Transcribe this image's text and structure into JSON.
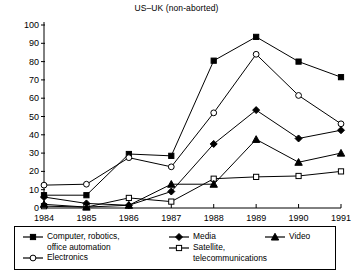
{
  "chart_data": {
    "type": "line",
    "title": "US–UK (non-aborted)",
    "xlabel": "",
    "ylabel": "",
    "categories": [
      "1984",
      "1985",
      "1986",
      "1987",
      "1988",
      "1989",
      "1990",
      "1991"
    ],
    "x": [
      1984,
      1985,
      1986,
      1987,
      1988,
      1989,
      1990,
      1991
    ],
    "xlim": [
      1984,
      1991
    ],
    "ylim": [
      0,
      100
    ],
    "yticks": [
      0,
      10,
      20,
      30,
      40,
      50,
      60,
      70,
      80,
      90,
      100
    ],
    "grid": false,
    "legend_position": "bottom",
    "series": [
      {
        "name": "Computer, robotics,\noffice automation",
        "marker": "filled-square",
        "values": [
          7,
          7,
          29.5,
          28.5,
          80.5,
          93.5,
          80,
          71.5
        ]
      },
      {
        "name": "Electronics",
        "marker": "open-circle",
        "values": [
          12.5,
          13,
          27.5,
          22.5,
          52,
          84,
          61.5,
          46
        ]
      },
      {
        "name": "Media",
        "marker": "filled-diamond",
        "values": [
          6,
          2.5,
          1.5,
          9,
          35,
          53.5,
          38,
          42.5
        ]
      },
      {
        "name": "Satellite,\ntelecommunications",
        "marker": "open-square",
        "values": [
          1,
          0.5,
          5.5,
          3.5,
          16,
          17,
          17.5,
          20
        ]
      },
      {
        "name": "Video",
        "marker": "filled-triangle",
        "values": [
          2,
          0.5,
          1.5,
          13,
          13,
          37.5,
          25,
          30
        ]
      }
    ]
  },
  "legend": {
    "entries": [
      {
        "label": "Computer, robotics,\noffice automation",
        "marker": "filled-square"
      },
      {
        "label": "Electronics",
        "marker": "open-circle"
      },
      {
        "label": "Media",
        "marker": "filled-diamond"
      },
      {
        "label": "Satellite,\ntelecommunications",
        "marker": "open-square"
      },
      {
        "label": "Video",
        "marker": "filled-triangle"
      }
    ]
  },
  "style": {
    "line_color": "#000000",
    "background": "#ffffff",
    "axis_color": "#000000"
  }
}
